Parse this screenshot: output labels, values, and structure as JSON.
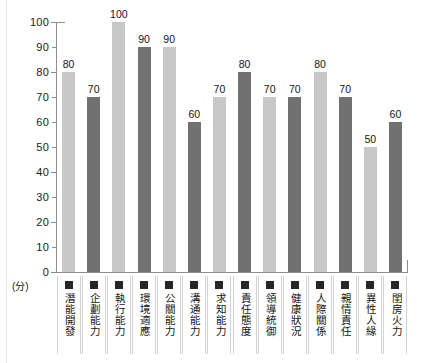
{
  "chart_data": {
    "type": "bar",
    "title": "",
    "xlabel": "",
    "ylabel": "(分)",
    "ylim": [
      0,
      100
    ],
    "ytick_step": 10,
    "yticks": [
      "100",
      "90",
      "80",
      "70",
      "60",
      "50",
      "40",
      "30",
      "20",
      "10",
      "0"
    ],
    "grid": false,
    "legend": "none",
    "unit_label": "(分)",
    "categories": [
      "潛能開發",
      "企劃能力",
      "執行能力",
      "環境適應",
      "公關能力",
      "溝通能力",
      "求知能力",
      "責任態度",
      "領導統御",
      "健康狀況",
      "人際關係",
      "親情責任",
      "異性人緣",
      "閨房火力"
    ],
    "values": [
      80,
      70,
      100,
      90,
      90,
      60,
      70,
      80,
      70,
      70,
      80,
      70,
      50,
      60
    ],
    "bar_shades": [
      "light",
      "dark",
      "light",
      "dark",
      "light",
      "dark",
      "light",
      "dark",
      "light",
      "dark",
      "light",
      "dark",
      "light",
      "dark"
    ],
    "value_labels": [
      "80",
      "70",
      "100",
      "90",
      "90",
      "60",
      "70",
      "80",
      "70",
      "70",
      "80",
      "70",
      "50",
      "60"
    ],
    "colors": {
      "bar_light": "#c7c7c7",
      "bar_dark": "#717171",
      "axis": "#8d8d8d",
      "text": "#151515",
      "marker": "#262626",
      "cell_border": "#d2d2d2",
      "background": "#ffffff"
    }
  }
}
